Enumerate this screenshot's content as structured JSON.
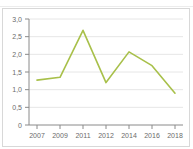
{
  "header": {
    "title_fragment": "",
    "value_fragment": ""
  },
  "chart_data": {
    "type": "line",
    "title": "",
    "xlabel": "",
    "ylabel": "",
    "x": [
      2007,
      2009,
      2011,
      2012,
      2014,
      2016,
      2018
    ],
    "categories": [
      "2007",
      "2009",
      "2011",
      "2012",
      "2014",
      "2016",
      "2018"
    ],
    "values": [
      1.27,
      1.35,
      2.68,
      1.2,
      2.07,
      1.68,
      0.9
    ],
    "series": [
      {
        "name": "",
        "values": [
          1.27,
          1.35,
          2.68,
          1.2,
          2.07,
          1.68,
          0.9
        ],
        "color": "#a8c04a"
      }
    ],
    "ylim": [
      0,
      3.0
    ],
    "yticks": [
      0,
      0.5,
      1.0,
      1.5,
      2.0,
      2.5,
      3.0
    ],
    "ytick_labels": [
      "0",
      "0,5",
      "1,0",
      "1,5",
      "2,0",
      "2,5",
      "3,0"
    ],
    "xtick_labels": [
      "2007",
      "2009",
      "2011",
      "2012",
      "2014",
      "2016",
      "2018"
    ],
    "grid": true,
    "grid_axis": "y",
    "legend": false,
    "legend_position": "none",
    "decimal_separator": ","
  },
  "colors": {
    "series": "#a8c04a",
    "grid": "#e6e6e6",
    "axis": "#8a8a8a",
    "tick_text": "#6b6b6b",
    "card_border": "#d8d8d8",
    "background": "#ffffff"
  }
}
